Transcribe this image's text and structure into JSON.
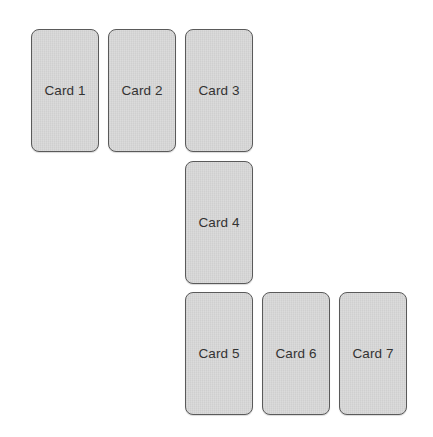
{
  "diagram": {
    "cards": [
      {
        "label": "Card 1"
      },
      {
        "label": "Card 2"
      },
      {
        "label": "Card 3"
      },
      {
        "label": "Card 4"
      },
      {
        "label": "Card 5"
      },
      {
        "label": "Card 6"
      },
      {
        "label": "Card 7"
      }
    ]
  },
  "colors": {
    "card_fill": "#d7d7d7",
    "card_border": "#5a5a5a",
    "label_text": "#333333",
    "background": "#ffffff"
  }
}
